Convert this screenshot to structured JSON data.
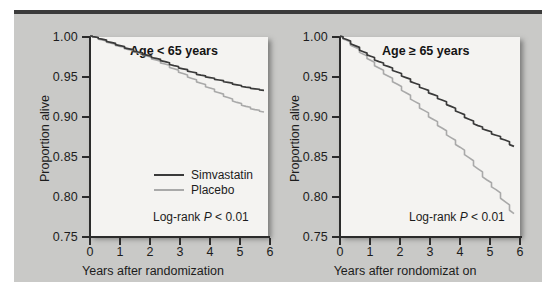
{
  "figure": {
    "background_color": "#c9c9c7",
    "plot_background_color": "#f4f3f1",
    "simvastatin_color": "#3a3a3a",
    "placebo_color": "#a9a9a9"
  },
  "panels": [
    {
      "id": "left",
      "title": "Age < 65 years",
      "xlabel": "Years after randomization",
      "ylabel": "Proportion alive",
      "pvalue_prefix": "Log-rank ",
      "pvalue_italic": "P",
      "pvalue_suffix": " < 0.01",
      "xticks": [
        "0",
        "1",
        "2",
        "3",
        "4",
        "5",
        "6"
      ],
      "yticks": [
        "1.00",
        "0.95",
        "0.90",
        "0.85",
        "0.80",
        "0.75"
      ],
      "legend": [
        {
          "label": "Simvastatin",
          "color": "#3a3a3a"
        },
        {
          "label": "Placebo",
          "color": "#a9a9a9"
        }
      ]
    },
    {
      "id": "right",
      "title": "Age ≥ 65 years",
      "xlabel": "Years after rondomizat on",
      "ylabel": "Proportion alive",
      "pvalue_prefix": "Log-rank ",
      "pvalue_italic": "P",
      "pvalue_suffix": " < 0.01",
      "xticks": [
        "0",
        "1",
        "2",
        "3",
        "4",
        "5",
        "6"
      ],
      "yticks": [
        "1.00",
        "0.95",
        "0.90",
        "0.85",
        "0.80",
        "0.75"
      ],
      "legend": []
    }
  ],
  "chart_data": [
    {
      "type": "line",
      "title": "Age < 65 years",
      "xlabel": "Years after randomization",
      "ylabel": "Proportion alive",
      "xlim": [
        0,
        6
      ],
      "ylim": [
        0.75,
        1.0
      ],
      "xticks": [
        0,
        1,
        2,
        3,
        4,
        5,
        6
      ],
      "yticks": [
        1.0,
        0.95,
        0.9,
        0.85,
        0.8,
        0.75
      ],
      "grid": false,
      "legend_position": "lower-right-inside",
      "annotation": "Log-rank P < 0.01",
      "series": [
        {
          "name": "Simvastatin",
          "color": "#3a3a3a",
          "x": [
            0,
            0.15,
            0.4,
            0.7,
            1.0,
            1.3,
            1.6,
            1.9,
            2.2,
            2.5,
            2.8,
            3.1,
            3.4,
            3.7,
            4.0,
            4.3,
            4.6,
            4.9,
            5.2,
            5.5,
            5.8
          ],
          "y": [
            1.0,
            0.999,
            0.996,
            0.992,
            0.988,
            0.984,
            0.98,
            0.976,
            0.972,
            0.968,
            0.963,
            0.959,
            0.955,
            0.951,
            0.948,
            0.945,
            0.942,
            0.939,
            0.936,
            0.934,
            0.932
          ]
        },
        {
          "name": "Placebo",
          "color": "#a9a9a9",
          "x": [
            0,
            0.15,
            0.4,
            0.7,
            1.0,
            1.3,
            1.6,
            1.9,
            2.2,
            2.5,
            2.8,
            3.1,
            3.4,
            3.7,
            4.0,
            4.3,
            4.6,
            4.9,
            5.2,
            5.5,
            5.8
          ],
          "y": [
            1.0,
            0.999,
            0.995,
            0.991,
            0.987,
            0.983,
            0.979,
            0.975,
            0.97,
            0.965,
            0.959,
            0.953,
            0.947,
            0.941,
            0.935,
            0.929,
            0.923,
            0.917,
            0.912,
            0.908,
            0.905
          ]
        }
      ]
    },
    {
      "type": "line",
      "title": "Age ≥ 65 years",
      "xlabel": "Years after rondomizat on",
      "ylabel": "Proportion alive",
      "xlim": [
        0,
        6
      ],
      "ylim": [
        0.75,
        1.0
      ],
      "xticks": [
        0,
        1,
        2,
        3,
        4,
        5,
        6
      ],
      "yticks": [
        1.0,
        0.95,
        0.9,
        0.85,
        0.8,
        0.75
      ],
      "grid": false,
      "legend_position": "none",
      "annotation": "Log-rank P < 0.01",
      "series": [
        {
          "name": "Simvastatin",
          "color": "#3a3a3a",
          "x": [
            0,
            0.2,
            0.5,
            0.8,
            1.0,
            1.3,
            1.6,
            1.9,
            2.2,
            2.5,
            2.8,
            3.1,
            3.4,
            3.7,
            4.0,
            4.3,
            4.6,
            4.9,
            5.2,
            5.5,
            5.8
          ],
          "y": [
            1.0,
            0.996,
            0.988,
            0.98,
            0.975,
            0.968,
            0.962,
            0.955,
            0.948,
            0.941,
            0.934,
            0.927,
            0.92,
            0.912,
            0.904,
            0.896,
            0.888,
            0.882,
            0.876,
            0.87,
            0.862
          ]
        },
        {
          "name": "Placebo",
          "color": "#a9a9a9",
          "x": [
            0,
            0.2,
            0.5,
            0.8,
            1.0,
            1.3,
            1.6,
            1.9,
            2.2,
            2.5,
            2.8,
            3.1,
            3.4,
            3.7,
            4.0,
            4.3,
            4.6,
            4.9,
            5.2,
            5.5,
            5.8
          ],
          "y": [
            1.0,
            0.995,
            0.986,
            0.977,
            0.97,
            0.96,
            0.95,
            0.94,
            0.929,
            0.918,
            0.907,
            0.896,
            0.885,
            0.873,
            0.861,
            0.848,
            0.834,
            0.82,
            0.808,
            0.793,
            0.778
          ]
        }
      ]
    }
  ]
}
